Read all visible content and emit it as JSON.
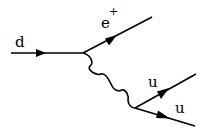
{
  "diagram": {
    "type": "feynman",
    "particles": {
      "incoming": {
        "label": "d"
      },
      "positron": {
        "label": "e",
        "superscript": "+"
      },
      "quark_upper": {
        "label": "u"
      },
      "quark_lower": {
        "label": "u"
      }
    },
    "propagator": {
      "kind": "wavy"
    },
    "colors": {
      "line": "#000000",
      "background": "#ffffff"
    }
  }
}
